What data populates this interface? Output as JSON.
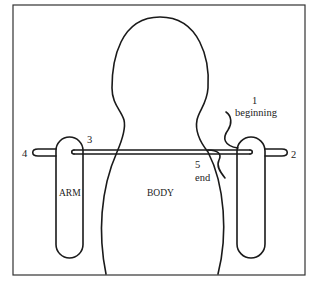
{
  "diagram": {
    "labels": {
      "body": "BODY",
      "arm": "ARM",
      "step1_number": "1",
      "step1_text": "beginning",
      "step2_number": "2",
      "step3_number": "3",
      "step4_number": "4",
      "step5_number": "5",
      "step5_text": "end"
    },
    "colors": {
      "line": "#1a1a1a",
      "frame": "#333333",
      "background": "#ffffff"
    }
  }
}
